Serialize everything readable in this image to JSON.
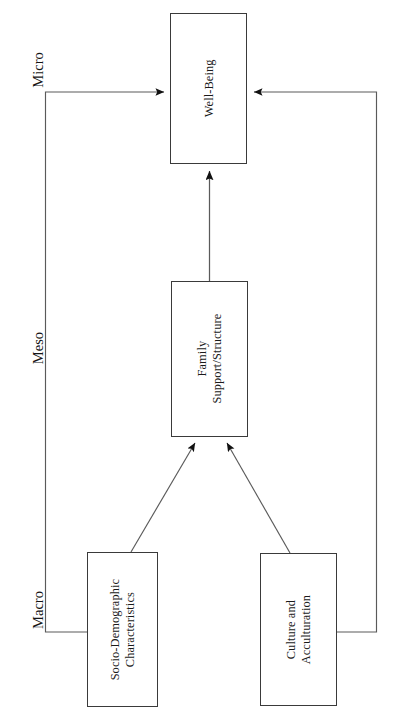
{
  "figure": {
    "kind": "conceptual-framework-diagram",
    "orientation": "rotated-90-degrees",
    "line_color": "#3a3a3a",
    "box_fill": "#ffffff",
    "text_color": "#1a1a1a"
  },
  "levels": [
    {
      "id": "micro",
      "label": "Micro"
    },
    {
      "id": "meso",
      "label": "Meso"
    },
    {
      "id": "macro",
      "label": "Macro"
    }
  ],
  "nodes": [
    {
      "id": "well-being",
      "label": "Well-Being",
      "level": "micro"
    },
    {
      "id": "family",
      "label": "Family\nSupport/Structure",
      "level": "meso"
    },
    {
      "id": "socio",
      "label": "Socio-Demographic\nCharacteristics",
      "level": "macro"
    },
    {
      "id": "culture",
      "label": "Culture and\nAcculturation",
      "level": "macro"
    }
  ],
  "edges": [
    {
      "id": "family-to-well-being",
      "from": "family",
      "to": "well-being",
      "style": "straight-arrow"
    },
    {
      "id": "socio-to-family",
      "from": "socio",
      "to": "family",
      "style": "diagonal-arrow"
    },
    {
      "id": "culture-to-family",
      "from": "culture",
      "to": "family",
      "style": "diagonal-arrow"
    },
    {
      "id": "socio-to-well-being",
      "from": "socio",
      "to": "well-being",
      "style": "orthogonal-arrow"
    },
    {
      "id": "culture-to-well-being",
      "from": "culture",
      "to": "well-being",
      "style": "orthogonal-arrow"
    }
  ]
}
